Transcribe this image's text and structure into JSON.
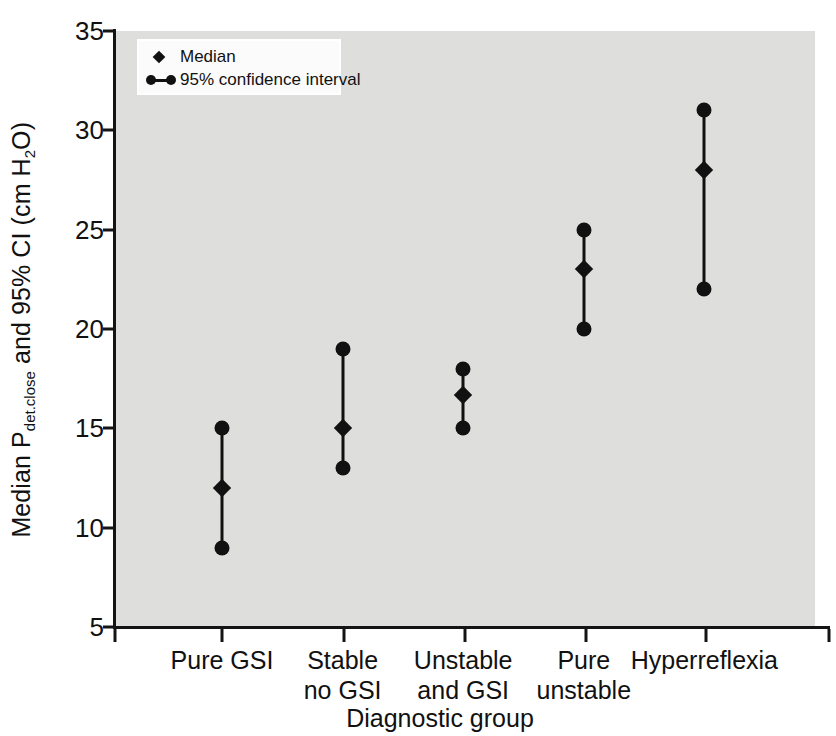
{
  "chart_data": {
    "type": "scatter",
    "title": "",
    "subtitle": "",
    "xlabel": "Diagnostic group",
    "ylabel_plain": "Median Pdet.close and 95% CI (cm H2O)",
    "ylabel_main_1": "Median P",
    "ylabel_sub": "det.close",
    "ylabel_main_2": " and 95% CI (cm H",
    "ylabel_sub_2": "2",
    "ylabel_main_3": "O)",
    "ylim": [
      5,
      35
    ],
    "yticks": [
      35,
      30,
      25,
      20,
      15,
      10,
      5
    ],
    "ytick_labels": [
      "35",
      "30",
      "25",
      "20",
      "15",
      "10",
      "5"
    ],
    "grid": false,
    "legend_position": "top-left",
    "categories": [
      "Pure GSI",
      "Stable no GSI",
      "Unstable and GSI",
      "Pure unstable",
      "Hyperreflexia"
    ],
    "category_lines": [
      [
        "Pure GSI",
        ""
      ],
      [
        "Stable",
        "no GSI"
      ],
      [
        "Unstable",
        "and GSI"
      ],
      [
        "Pure",
        "unstable"
      ],
      [
        "Hyperreflexia",
        ""
      ]
    ],
    "series": [
      {
        "name": "Median",
        "marker": "diamond",
        "values": [
          12,
          15,
          16.7,
          23,
          28
        ]
      },
      {
        "name": "95% confidence interval",
        "marker": "dot-line-dot",
        "lower": [
          9,
          13,
          15,
          20,
          22
        ],
        "upper": [
          15,
          19,
          18,
          25,
          31
        ]
      }
    ],
    "legend": [
      {
        "label": "Median",
        "key": "diamond"
      },
      {
        "label": "95% confidence interval",
        "key": "dot-line-dot"
      }
    ],
    "colors": {
      "plot_background": "#dededd",
      "marker": "#111111",
      "axis": "#141414",
      "page_background": "#ffffff",
      "legend_background": "#fbfbfb"
    }
  }
}
